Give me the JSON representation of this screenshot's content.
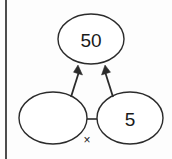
{
  "diagram": {
    "type": "number-bond",
    "nodes": {
      "product": {
        "label": "50",
        "role": "product",
        "shape": "ellipse",
        "cx": 91,
        "cy": 39,
        "rx": 33,
        "ry": 25
      },
      "factor_left": {
        "label": "",
        "role": "missing-factor",
        "shape": "ellipse",
        "cx": 53,
        "cy": 118,
        "rx": 34,
        "ry": 26
      },
      "factor_right": {
        "label": "5",
        "role": "known-factor",
        "shape": "ellipse",
        "cx": 130,
        "cy": 118,
        "rx": 33,
        "ry": 26
      }
    },
    "operator": {
      "symbol": "×",
      "name": "multiplication-sign",
      "x": 87,
      "y": 140
    },
    "connector": {
      "name": "factor-connector",
      "x1": 87,
      "y1": 119,
      "x2": 97,
      "y2": 119
    },
    "arrows": [
      {
        "name": "arrow-left-factor-to-product",
        "from": "factor_left",
        "to": "product",
        "x1": 71,
        "y1": 97,
        "x2": 78,
        "y2": 66
      },
      {
        "name": "arrow-right-factor-to-product",
        "from": "factor_right",
        "to": "product",
        "x1": 113,
        "y1": 97,
        "x2": 105,
        "y2": 66
      }
    ],
    "margin_rule": {
      "name": "page-margin-line",
      "x": 6,
      "y1": 0,
      "y2": 159
    },
    "colors": {
      "background": "#fdfdfd",
      "stroke": "#2b2b2b",
      "text": "#1a1a1a",
      "margin": "#3a3a3a"
    }
  }
}
